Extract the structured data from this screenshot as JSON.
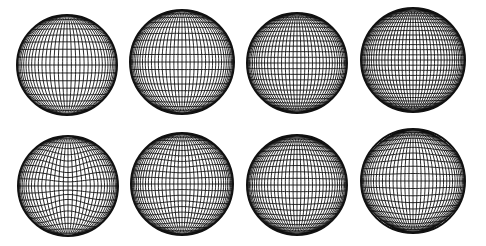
{
  "figure": {
    "background": "#ffffff",
    "line_color": "#111111",
    "grid": {
      "rows": 2,
      "cols": 4
    },
    "spheres": [
      {
        "id": "sphere-1",
        "row": 0,
        "col": 0,
        "cx": 67,
        "cy": 65,
        "r": 50,
        "meridians": 36,
        "parallels": 20,
        "deform": "none",
        "amount": 0.0
      },
      {
        "id": "sphere-2",
        "row": 0,
        "col": 1,
        "cx": 182,
        "cy": 62,
        "r": 52,
        "meridians": 40,
        "parallels": 22,
        "deform": "none",
        "amount": 0.0
      },
      {
        "id": "sphere-3",
        "row": 0,
        "col": 2,
        "cx": 297,
        "cy": 63,
        "r": 50,
        "meridians": 40,
        "parallels": 28,
        "deform": "none",
        "amount": 0.0
      },
      {
        "id": "sphere-4",
        "row": 0,
        "col": 3,
        "cx": 413,
        "cy": 60,
        "r": 52,
        "meridians": 44,
        "parallels": 32,
        "deform": "none",
        "amount": 0.0
      },
      {
        "id": "sphere-5",
        "row": 1,
        "col": 0,
        "cx": 68,
        "cy": 186,
        "r": 50,
        "meridians": 36,
        "parallels": 22,
        "deform": "waist",
        "amount": 0.45
      },
      {
        "id": "sphere-6",
        "row": 1,
        "col": 1,
        "cx": 182,
        "cy": 184,
        "r": 51,
        "meridians": 40,
        "parallels": 24,
        "deform": "waist",
        "amount": 0.18
      },
      {
        "id": "sphere-7",
        "row": 1,
        "col": 2,
        "cx": 297,
        "cy": 185,
        "r": 50,
        "meridians": 40,
        "parallels": 26,
        "deform": "bulge",
        "amount": 0.25
      },
      {
        "id": "sphere-8",
        "row": 1,
        "col": 3,
        "cx": 413,
        "cy": 181,
        "r": 52,
        "meridians": 40,
        "parallels": 26,
        "deform": "bulge",
        "amount": 0.5
      }
    ]
  }
}
